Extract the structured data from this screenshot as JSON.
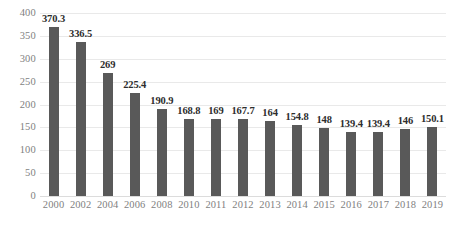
{
  "chart_data": {
    "type": "bar",
    "title": "",
    "subtitle": "",
    "xlabel": "",
    "ylabel": "",
    "ylim": [
      0,
      400
    ],
    "yticks": [
      0,
      50,
      100,
      150,
      200,
      250,
      300,
      350,
      400
    ],
    "ytick_labels": [
      "0",
      "50",
      "100",
      "150",
      "200",
      "250",
      "300",
      "350",
      "400"
    ],
    "grid": true,
    "legend": false,
    "legend_position": "none",
    "bar_color": "#595959",
    "gridline_color": "#e9e9e9",
    "tick_label_color": "#7f7f7f",
    "data_label_color": "#2d2d2d",
    "categories": [
      "2000",
      "2002",
      "2004",
      "2006",
      "2008",
      "2010",
      "2011",
      "2012",
      "2013",
      "2014",
      "2015",
      "2016",
      "2017",
      "2018",
      "2019"
    ],
    "values": [
      370.3,
      336.5,
      269,
      225.4,
      190.9,
      168.8,
      169,
      167.7,
      164,
      154.8,
      148,
      139.4,
      139.4,
      146,
      150.1
    ],
    "data_labels": [
      "370.3",
      "336.5",
      "269",
      "225.4",
      "190.9",
      "168.8",
      "169",
      "167.7",
      "164",
      "154.8",
      "148",
      "139.4",
      "139.4",
      "146",
      "150.1"
    ]
  }
}
